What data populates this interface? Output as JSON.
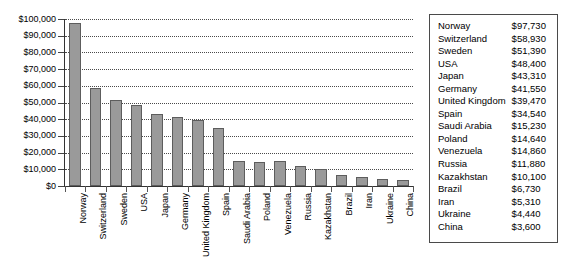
{
  "chart_data": {
    "type": "bar",
    "title": "",
    "xlabel": "",
    "ylabel": "",
    "ylim": [
      0,
      100000
    ],
    "ytick_values": [
      0,
      10000,
      20000,
      30000,
      40000,
      50000,
      60000,
      70000,
      80000,
      90000,
      100000
    ],
    "ytick_labels": [
      "$0",
      "$10,000",
      "$20,000",
      "$30,000",
      "$40,000",
      "$50,000",
      "$60,000",
      "$70,000",
      "$80,000",
      "$90,000",
      "$100,000"
    ],
    "grid": true,
    "grid_style": "dotted-horizontal",
    "legend": "none",
    "bar_color": "#9a9a9a",
    "bar_edge_color": "#5d5d5d",
    "categories": [
      "Norway",
      "Switzerland",
      "Sweden",
      "USA",
      "Japan",
      "Germany",
      "United Kingdom",
      "Spain",
      "Saudi Arabia",
      "Poland",
      "Venezuela",
      "Russia",
      "Kazakhstan",
      "Brazil",
      "Iran",
      "Ukraine",
      "China"
    ],
    "values": [
      97730,
      58930,
      51390,
      48400,
      43310,
      41550,
      39470,
      34540,
      15230,
      14640,
      14860,
      11880,
      10100,
      6730,
      5310,
      4440,
      3600
    ],
    "value_labels": [
      "$97,730",
      "$58,930",
      "$51,390",
      "$48,400",
      "$43,310",
      "$41,550",
      "$39,470",
      "$34,540",
      "$15,230",
      "$14,640",
      "$14,860",
      "$11,880",
      "$10,100",
      "$6,730",
      "$5,310",
      "$4,440",
      "$3,600"
    ]
  },
  "table": {
    "rows": [
      {
        "country": "Norway",
        "value": "$97,730"
      },
      {
        "country": "Switzerland",
        "value": "$58,930"
      },
      {
        "country": "Sweden",
        "value": "$51,390"
      },
      {
        "country": "USA",
        "value": "$48,400"
      },
      {
        "country": "Japan",
        "value": "$43,310"
      },
      {
        "country": "Germany",
        "value": "$41,550"
      },
      {
        "country": "United Kingdom",
        "value": "$39,470"
      },
      {
        "country": "Spain",
        "value": "$34,540"
      },
      {
        "country": "Saudi Arabia",
        "value": "$15,230"
      },
      {
        "country": "Poland",
        "value": "$14,640"
      },
      {
        "country": "Venezuela",
        "value": "$14,860"
      },
      {
        "country": "Russia",
        "value": "$11,880"
      },
      {
        "country": "Kazakhstan",
        "value": "$10,100"
      },
      {
        "country": "Brazil",
        "value": "$6,730"
      },
      {
        "country": "Iran",
        "value": "$5,310"
      },
      {
        "country": "Ukraine",
        "value": "$4,440"
      },
      {
        "country": "China",
        "value": "$3,600"
      }
    ]
  }
}
